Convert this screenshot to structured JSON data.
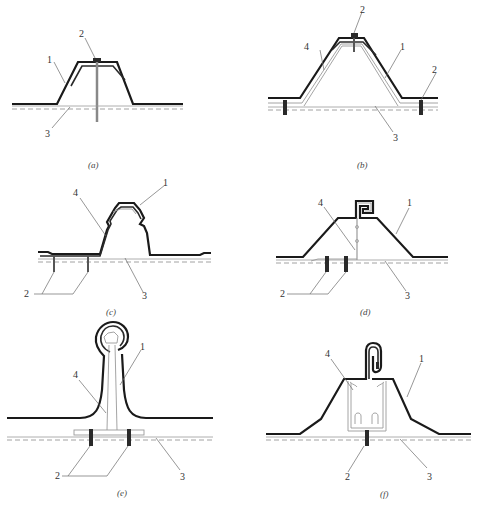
{
  "figure": {
    "panels": [
      {
        "id": "a",
        "caption": "(a)",
        "labels": {
          "sheet": "1",
          "fastener": "2",
          "purlin": "3"
        }
      },
      {
        "id": "b",
        "caption": "(b)",
        "labels": {
          "sheet": "1",
          "fastener_top": "2",
          "fastener_right": "2",
          "purlin": "3",
          "inner_sheet": "4"
        }
      },
      {
        "id": "c",
        "caption": "(c)",
        "labels": {
          "sheet": "1",
          "fastener": "2",
          "purlin": "3",
          "clip": "4"
        }
      },
      {
        "id": "d",
        "caption": "(d)",
        "labels": {
          "sheet": "1",
          "fastener": "2",
          "purlin": "3",
          "clip": "4"
        }
      },
      {
        "id": "e",
        "caption": "(e)",
        "labels": {
          "sheet": "1",
          "fastener": "2",
          "purlin": "3",
          "clip": "4"
        }
      },
      {
        "id": "f",
        "caption": "(f)",
        "labels": {
          "sheet": "1",
          "fastener": "2",
          "purlin": "3",
          "clip": "4"
        }
      }
    ]
  }
}
